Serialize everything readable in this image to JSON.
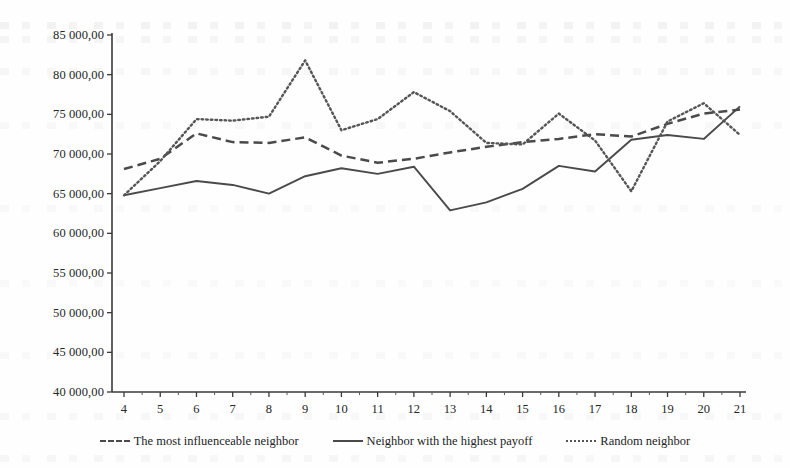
{
  "chart_data": {
    "type": "line",
    "title": "",
    "xlabel": "",
    "ylabel": "",
    "grid": false,
    "legend_position": "bottom",
    "x": [
      4,
      5,
      6,
      7,
      8,
      9,
      10,
      11,
      12,
      13,
      14,
      15,
      16,
      17,
      18,
      19,
      20,
      21
    ],
    "xtick_labels": [
      "4",
      "5",
      "6",
      "7",
      "8",
      "9",
      "10",
      "11",
      "12",
      "13",
      "14",
      "15",
      "16",
      "17",
      "18",
      "19",
      "20",
      "21"
    ],
    "ylim": [
      40000,
      85000
    ],
    "ytick_values": [
      40000,
      45000,
      50000,
      55000,
      60000,
      65000,
      70000,
      75000,
      80000,
      85000
    ],
    "ytick_labels": [
      "40 000,00",
      "45 000,00",
      "50 000,00",
      "55 000,00",
      "60 000,00",
      "65 000,00",
      "70 000,00",
      "75 000,00",
      "80 000,00",
      "85 000,00"
    ],
    "series": [
      {
        "name": "The most influenceable neighbor",
        "style": "dashed",
        "color": "#4a4a4a",
        "values": [
          68100,
          69400,
          72600,
          71500,
          71400,
          72100,
          69800,
          68900,
          69400,
          70200,
          70900,
          71500,
          71900,
          72500,
          72200,
          73800,
          75100,
          75600
        ]
      },
      {
        "name": "Neighbor with the highest payoff",
        "style": "solid",
        "color": "#4a4a4a",
        "values": [
          64800,
          65700,
          66600,
          66100,
          65000,
          67200,
          68200,
          67500,
          68400,
          62900,
          63900,
          65600,
          68500,
          67800,
          71800,
          72400,
          71900,
          76000
        ]
      },
      {
        "name": "Random neighbor",
        "style": "dotted",
        "color": "#555555",
        "values": [
          64800,
          69100,
          74400,
          74200,
          74700,
          81800,
          73000,
          74400,
          77800,
          75400,
          71400,
          71200,
          75100,
          71700,
          65300,
          74100,
          76400,
          72400
        ]
      }
    ]
  },
  "legend": {
    "entries": [
      {
        "label": "The most influenceable neighbor",
        "style": "dashed"
      },
      {
        "label": "Neighbor with the highest payoff",
        "style": "solid"
      },
      {
        "label": "Random neighbor",
        "style": "dotted"
      }
    ]
  }
}
